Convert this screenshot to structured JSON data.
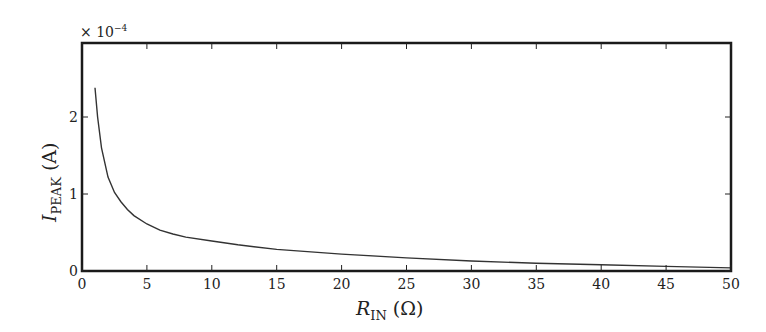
{
  "chart_data": {
    "type": "line",
    "title": "",
    "xlabel": "R_IN (Ω)",
    "xlabel_main": "R",
    "xlabel_sub": "IN",
    "xlabel_unit": " (Ω)",
    "ylabel": "I_PEAK (A)",
    "ylabel_main": "I",
    "ylabel_sub": "PEAK",
    "ylabel_unit": " (A)",
    "y_multiplier": "× 10",
    "y_multiplier_exp": "−4",
    "xlim": [
      0,
      50
    ],
    "ylim": [
      0,
      2.55
    ],
    "xticks": [
      0,
      5,
      10,
      15,
      20,
      25,
      30,
      35,
      40,
      45,
      50
    ],
    "yticks": [
      0,
      1,
      2
    ],
    "grid": false,
    "legend": null,
    "series": [
      {
        "name": "I_PEAK",
        "color": "#333333",
        "x": [
          1,
          1.2,
          1.5,
          2,
          2.5,
          3,
          3.5,
          4,
          5,
          6,
          7,
          8,
          10,
          12,
          15,
          20,
          25,
          30,
          35,
          40,
          45,
          50
        ],
        "y": [
          2.38,
          2.0,
          1.6,
          1.22,
          1.02,
          0.9,
          0.8,
          0.72,
          0.61,
          0.53,
          0.48,
          0.44,
          0.39,
          0.34,
          0.28,
          0.22,
          0.17,
          0.13,
          0.1,
          0.08,
          0.06,
          0.04
        ]
      }
    ]
  }
}
